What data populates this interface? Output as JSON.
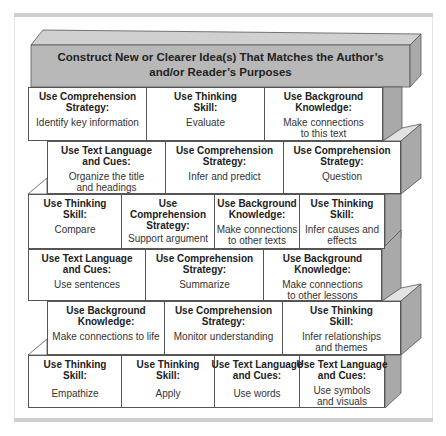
{
  "title": {
    "line1": "Construct New or Clearer Idea(s) That Matches the Author’s",
    "line2": "and/or Reader’s Purposes"
  },
  "rows": [
    [
      {
        "heading": [
          "Use Comprehension",
          "Strategy:"
        ],
        "body": [
          "Identify key information"
        ]
      },
      {
        "heading": [
          "Use Thinking",
          "Skill:"
        ],
        "body": [
          "Evaluate"
        ]
      },
      {
        "heading": [
          "Use Background",
          "Knowledge:"
        ],
        "body": [
          "Make connections",
          "to this text"
        ]
      }
    ],
    [
      {
        "heading": [
          "Use Text Language",
          "and Cues:"
        ],
        "body": [
          "Organize the title",
          "and headings"
        ]
      },
      {
        "heading": [
          "Use Comprehension",
          "Strategy:"
        ],
        "body": [
          "Infer and predict"
        ]
      },
      {
        "heading": [
          "Use Comprehension",
          "Strategy:"
        ],
        "body": [
          "Question"
        ]
      }
    ],
    [
      {
        "heading": [
          "Use Thinking",
          "Skill:"
        ],
        "body": [
          "Compare"
        ]
      },
      {
        "heading": [
          "Use",
          "Comprehension",
          "Strategy:"
        ],
        "body": [
          "Support argument"
        ]
      },
      {
        "heading": [
          "Use Background",
          "Knowledge:"
        ],
        "body": [
          "Make connections",
          "to other texts"
        ]
      },
      {
        "heading": [
          "Use Thinking",
          "Skill:"
        ],
        "body": [
          "Infer causes and",
          "effects"
        ]
      }
    ],
    [
      {
        "heading": [
          "Use Text Language",
          "and Cues:"
        ],
        "body": [
          "Use sentences"
        ]
      },
      {
        "heading": [
          "Use Comprehension",
          "Strategy:"
        ],
        "body": [
          "Summarize"
        ]
      },
      {
        "heading": [
          "Use Background",
          "Knowledge:"
        ],
        "body": [
          "Make connections",
          "to other lessons"
        ]
      }
    ],
    [
      {
        "heading": [
          "Use Background",
          "Knowledge:"
        ],
        "body": [
          "Make connections to life"
        ]
      },
      {
        "heading": [
          "Use Comprehension",
          "Strategy:"
        ],
        "body": [
          "Monitor understanding"
        ]
      },
      {
        "heading": [
          "Use Thinking",
          "Skill:"
        ],
        "body": [
          "Infer relationships",
          "and themes"
        ]
      }
    ],
    [
      {
        "heading": [
          "Use Thinking",
          "Skill:"
        ],
        "body": [
          "Empathize"
        ]
      },
      {
        "heading": [
          "Use Thinking",
          "Skill:"
        ],
        "body": [
          "Apply"
        ]
      },
      {
        "heading": [
          "Use Text Language",
          "and Cues:"
        ],
        "body": [
          "Use words"
        ]
      },
      {
        "heading": [
          "Use Text Language",
          "and Cues:"
        ],
        "body": [
          "Use symbols",
          "and visuals"
        ]
      }
    ]
  ],
  "colors": {
    "slab_front": "#b8b8b8",
    "slab_top": "#d0d0d0",
    "side": "#a9a9a9",
    "side_top": "#e2e2e2",
    "cell_bg": "#ffffff",
    "stroke": "#555555"
  }
}
